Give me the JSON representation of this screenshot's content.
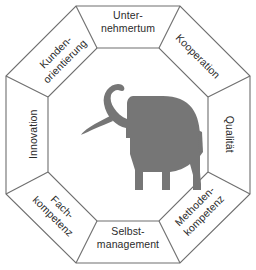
{
  "diagram": {
    "shape": "octagon",
    "background_color": "#ffffff",
    "line_color": "#6f6f6f",
    "text_color": "#2b2b2b",
    "center_figure": {
      "name": "elephant-silhouette",
      "description": "Elefant",
      "fill_color": "#767676"
    },
    "segments": [
      {
        "id": "unternehmertum",
        "position": "top",
        "line1": "Unter-",
        "line2": "nehmertum"
      },
      {
        "id": "kooperation",
        "position": "top-right",
        "line1": "Kooperation",
        "line2": ""
      },
      {
        "id": "qualitaet",
        "position": "right",
        "line1": "Qualität",
        "line2": ""
      },
      {
        "id": "methodenkompetenz",
        "position": "bottom-right",
        "line1": "Methoden-",
        "line2": "kompetenz"
      },
      {
        "id": "selbstmanagement",
        "position": "bottom",
        "line1": "Selbst-",
        "line2": "management"
      },
      {
        "id": "fachkompetenz",
        "position": "bottom-left",
        "line1": "Fach-",
        "line2": "kompetenz"
      },
      {
        "id": "innovation",
        "position": "left",
        "line1": "Innovation",
        "line2": ""
      },
      {
        "id": "kundenorientierung",
        "position": "top-left",
        "line1": "Kunden-",
        "line2": "orientierung"
      }
    ]
  }
}
